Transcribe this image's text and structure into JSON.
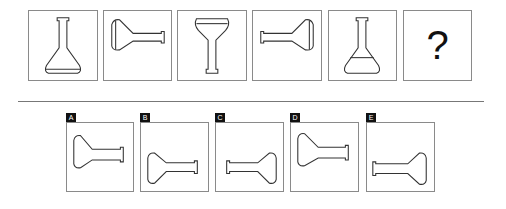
{
  "puzzle": {
    "sequence": [
      {
        "id": "1",
        "shape": "flask-upright",
        "content": ""
      },
      {
        "id": "2",
        "shape": "flask-pointing-right",
        "content": ""
      },
      {
        "id": "3",
        "shape": "flask-upside-down",
        "content": ""
      },
      {
        "id": "4",
        "shape": "flask-pointing-left",
        "content": ""
      },
      {
        "id": "5",
        "shape": "flask-upright",
        "content": ""
      },
      {
        "id": "6",
        "shape": "unknown",
        "content": "?"
      }
    ],
    "options": [
      {
        "label": "A",
        "shape": "flask-pointing-right"
      },
      {
        "label": "B",
        "shape": "flask-pointing-right-low"
      },
      {
        "label": "C",
        "shape": "flask-pointing-left-low"
      },
      {
        "label": "D",
        "shape": "flask-pointing-right"
      },
      {
        "label": "E",
        "shape": "flask-pointing-left-low"
      }
    ]
  }
}
